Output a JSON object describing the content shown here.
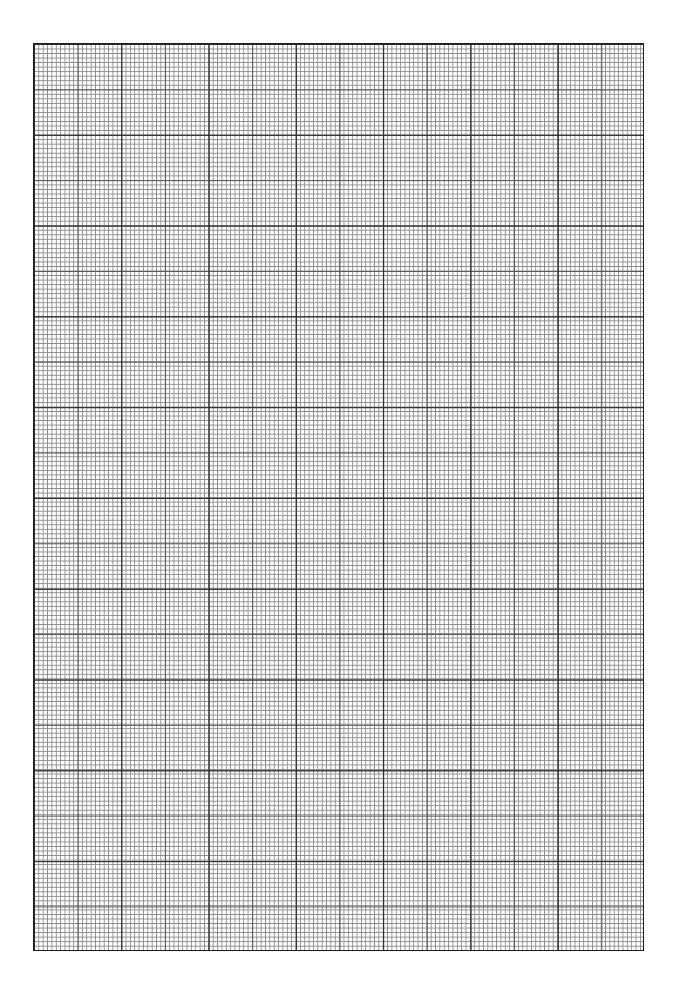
{
  "page": {
    "type": "graph-paper",
    "background_color": "#ffffff",
    "line_color_major": "#2a2a2a",
    "line_color_medium": "#555555",
    "line_color_minor": "#8a8a8a"
  },
  "grid": {
    "left_px": 33,
    "top_px": 43,
    "width_px": 611,
    "height_px": 908,
    "major_columns": 7,
    "major_rows": 10,
    "cells_per_major": 20,
    "medium_line_every_cells": 10,
    "total_cell_columns": 140,
    "total_cell_rows": 200
  }
}
